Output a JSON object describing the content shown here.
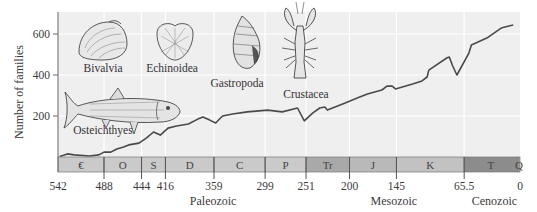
{
  "chart_data": {
    "type": "line",
    "title": "",
    "xlabel": "Millions of years ago",
    "ylabel": "Number of families",
    "xlim": [
      542,
      0
    ],
    "ylim": [
      0,
      700
    ],
    "y_ticks": [
      200,
      400,
      600
    ],
    "x_ticks": [
      {
        "value": 542,
        "label": "542"
      },
      {
        "value": 488,
        "label": "488"
      },
      {
        "value": 444,
        "label": "444"
      },
      {
        "value": 416,
        "label": "416"
      },
      {
        "value": 359,
        "label": "359"
      },
      {
        "value": 299,
        "label": "299"
      },
      {
        "value": 251,
        "label": "251"
      },
      {
        "value": 200,
        "label": "200"
      },
      {
        "value": 145,
        "label": "145"
      },
      {
        "value": 65.5,
        "label": "65.5"
      },
      {
        "value": 0,
        "label": "0"
      }
    ],
    "grid": true,
    "series": [
      {
        "name": "Marine animal families",
        "x": [
          540,
          531,
          523,
          505,
          494,
          488,
          480,
          473,
          465,
          459,
          447,
          438,
          430,
          422,
          413,
          403,
          389,
          378,
          372,
          364,
          357,
          349,
          337,
          320,
          296,
          279,
          261,
          253,
          243,
          235,
          229,
          226,
          208,
          191,
          179,
          162,
          156,
          150,
          146,
          126,
          115,
          109,
          107,
          86,
          83,
          79,
          74,
          60,
          57,
          39,
          22,
          13,
          8
        ],
        "values": [
          2,
          15,
          10,
          5,
          10,
          24,
          24,
          39,
          49,
          59,
          68,
          93,
          122,
          107,
          141,
          151,
          161,
          185,
          195,
          180,
          166,
          200,
          210,
          220,
          229,
          220,
          239,
          176,
          215,
          239,
          244,
          229,
          259,
          288,
          307,
          327,
          346,
          346,
          332,
          356,
          371,
          390,
          424,
          483,
          488,
          444,
          400,
          507,
          546,
          580,
          629,
          639,
          644
        ]
      }
    ],
    "periods": [
      {
        "label": "€",
        "start": 542,
        "end": 488,
        "color": "#cacaca"
      },
      {
        "label": "O",
        "start": 488,
        "end": 444,
        "color": "#cacaca"
      },
      {
        "label": "S",
        "start": 444,
        "end": 416,
        "color": "#cacaca"
      },
      {
        "label": "D",
        "start": 416,
        "end": 359,
        "color": "#cacaca"
      },
      {
        "label": "C",
        "start": 359,
        "end": 299,
        "color": "#cacaca"
      },
      {
        "label": "P",
        "start": 299,
        "end": 251,
        "color": "#cacaca"
      },
      {
        "label": "Tr",
        "start": 251,
        "end": 200,
        "color": "#a9a9a9"
      },
      {
        "label": "J",
        "start": 200,
        "end": 145,
        "color": "#b9b9b9"
      },
      {
        "label": "K",
        "start": 145,
        "end": 65.5,
        "color": "#c2c2c2"
      },
      {
        "label": "T",
        "start": 65.5,
        "end": 2.6,
        "color": "#8c8c8c"
      },
      {
        "label": "Q",
        "start": 2.6,
        "end": 0,
        "color": "#9c9c9c"
      }
    ],
    "eras": [
      {
        "label": "Paleozoic",
        "center": 360
      },
      {
        "label": "Mesozoic",
        "center": 148
      },
      {
        "label": "Cenozoic",
        "center": 30
      }
    ],
    "annotations": [
      {
        "label": "Bivalvia",
        "x": 103,
        "y": 72
      },
      {
        "label": "Echinoidea",
        "x": 172,
        "y": 72
      },
      {
        "label": "Gastropoda",
        "x": 237,
        "y": 87
      },
      {
        "label": "Crustacea",
        "x": 306,
        "y": 98
      },
      {
        "label": "Osteichthyes",
        "x": 103,
        "y": 134
      }
    ]
  },
  "colors": {
    "plot_background": "#efefef",
    "gridline": "#ffffff",
    "line": "#4a4a4a",
    "axis": "#666666"
  }
}
